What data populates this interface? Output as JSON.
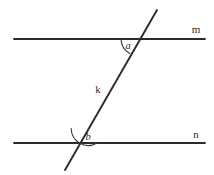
{
  "figure": {
    "type": "geometry-diagram",
    "background_color": "#ffffff",
    "stroke_color": "#2b2b2b",
    "width": 214,
    "height": 175
  },
  "lines": [
    {
      "id": "m",
      "label": "m",
      "role": "parallel-line-upper",
      "label_x": 196,
      "label_y": 33,
      "x1": 14,
      "y1": 39,
      "x2": 205,
      "y2": 39
    },
    {
      "id": "n",
      "label": "n",
      "role": "parallel-line-lower",
      "label_x": 196,
      "label_y": 138,
      "x1": 14,
      "y1": 143,
      "x2": 205,
      "y2": 143
    },
    {
      "id": "k",
      "label": "k",
      "role": "transversal-line",
      "label_x": 98,
      "label_y": 93,
      "x1": 157,
      "y1": 10,
      "x2": 65,
      "y2": 170
    }
  ],
  "angles": [
    {
      "id": "a",
      "label": "a",
      "position": "below-line-m-left-of-transversal",
      "vertex_x": 138,
      "vertex_y": 39,
      "label_x": 128,
      "label_y": 49,
      "arc_path": "M 121 39 A 17 17 0 0 0 129.8 53.5",
      "arc_radius": 17
    },
    {
      "id": "b",
      "label": "b",
      "position": "above-line-n-right-of-transversal",
      "vertex_x": 80,
      "vertex_y": 143,
      "label_x": 88,
      "label_y": 140,
      "arc_path": "M 71.2 128.5 A 17 17 0 0 0 97 143",
      "arc_radius": 17
    }
  ],
  "intersections": [
    {
      "line": "m",
      "transversal": "k",
      "x": 138,
      "y": 39
    },
    {
      "line": "n",
      "transversal": "k",
      "x": 80,
      "y": 143
    }
  ]
}
